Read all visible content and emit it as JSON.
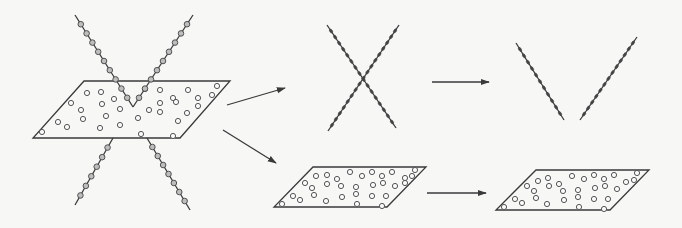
{
  "figure": {
    "type": "schematic",
    "colors": {
      "ink": "#3a3a3a",
      "paper": "#f7f7f5"
    }
  },
  "panels": {
    "source": {
      "plane": [
        [
          84,
          81
        ],
        [
          230,
          81
        ],
        [
          180,
          138
        ],
        [
          33,
          138
        ]
      ],
      "plane_dots": [
        [
          87,
          93
        ],
        [
          101,
          92
        ],
        [
          114,
          99
        ],
        [
          71,
          103
        ],
        [
          81,
          110
        ],
        [
          102,
          104
        ],
        [
          120,
          109
        ],
        [
          145,
          89
        ],
        [
          160,
          90
        ],
        [
          173,
          98
        ],
        [
          188,
          90
        ],
        [
          198,
          98
        ],
        [
          212,
          95
        ],
        [
          217,
          86
        ],
        [
          160,
          103
        ],
        [
          176,
          102
        ],
        [
          198,
          106
        ],
        [
          83,
          119
        ],
        [
          106,
          116
        ],
        [
          149,
          110
        ],
        [
          187,
          113
        ],
        [
          58,
          122
        ],
        [
          67,
          127
        ],
        [
          100,
          128
        ],
        [
          120,
          125
        ],
        [
          138,
          118
        ],
        [
          160,
          112
        ],
        [
          178,
          121
        ],
        [
          42,
          132
        ],
        [
          141,
          134
        ],
        [
          173,
          136
        ]
      ],
      "line_upper_left": {
        "from": [
          75,
          15
        ],
        "to": [
          133,
          107
        ],
        "marker": "grey-ring"
      },
      "line_upper_right": {
        "from": [
          193,
          15
        ],
        "to": [
          133,
          107
        ],
        "marker": "grey-ring"
      },
      "line_lower_left": {
        "from": [
          113,
          138
        ],
        "to": [
          75,
          205
        ],
        "marker": "grey-ring"
      },
      "line_lower_right": {
        "from": [
          147,
          138
        ],
        "to": [
          190,
          210
        ],
        "marker": "grey-ring"
      }
    },
    "arrows": [
      {
        "name": "arrow-source-to-lines",
        "from": [
          227,
          105
        ],
        "to": [
          285,
          88
        ]
      },
      {
        "name": "arrow-source-to-plane",
        "from": [
          223,
          130
        ],
        "to": [
          276,
          163
        ]
      },
      {
        "name": "arrow-lines-to-v",
        "from": [
          432,
          82
        ],
        "to": [
          489,
          82
        ]
      },
      {
        "name": "arrow-plane-to-plane",
        "from": [
          427,
          193
        ],
        "to": [
          486,
          193
        ]
      }
    ],
    "middle_lines": {
      "line_a": {
        "from": [
          327,
          25
        ],
        "to": [
          396,
          128
        ],
        "marker": "solid"
      },
      "line_b": {
        "from": [
          399,
          25
        ],
        "to": [
          328,
          131
        ],
        "marker": "solid"
      }
    },
    "middle_plane": {
      "plane": [
        [
          313,
          167
        ],
        [
          426,
          167
        ],
        [
          387,
          207
        ],
        [
          274,
          207
        ]
      ],
      "plane_dots": [
        [
          316,
          176
        ],
        [
          327,
          175
        ],
        [
          350,
          172
        ],
        [
          362,
          176
        ],
        [
          372,
          172
        ],
        [
          382,
          176
        ],
        [
          392,
          172
        ],
        [
          415,
          170
        ],
        [
          405,
          178
        ],
        [
          412,
          176
        ],
        [
          305,
          183
        ],
        [
          312,
          188
        ],
        [
          327,
          184
        ],
        [
          337,
          179
        ],
        [
          341,
          186
        ],
        [
          356,
          187
        ],
        [
          373,
          185
        ],
        [
          383,
          183
        ],
        [
          395,
          186
        ],
        [
          293,
          196
        ],
        [
          300,
          200
        ],
        [
          314,
          195
        ],
        [
          326,
          201
        ],
        [
          342,
          197
        ],
        [
          356,
          194
        ],
        [
          372,
          196
        ],
        [
          386,
          196
        ],
        [
          282,
          204
        ],
        [
          357,
          204
        ],
        [
          382,
          206
        ],
        [
          405,
          183
        ]
      ]
    },
    "right_v": {
      "line_left": {
        "from": [
          516,
          43
        ],
        "to": [
          564,
          120
        ],
        "marker": "solid"
      },
      "line_right": {
        "from": [
          637,
          37
        ],
        "to": [
          580,
          120
        ],
        "marker": "solid"
      }
    },
    "right_plane": {
      "plane": [
        [
          536,
          170
        ],
        [
          649,
          170
        ],
        [
          610,
          210
        ],
        [
          496,
          210
        ]
      ],
      "plane_dots": [
        [
          538,
          181
        ],
        [
          548,
          178
        ],
        [
          572,
          176
        ],
        [
          584,
          179
        ],
        [
          594,
          175
        ],
        [
          604,
          179
        ],
        [
          614,
          175
        ],
        [
          637,
          173
        ],
        [
          626,
          182
        ],
        [
          634,
          180
        ],
        [
          527,
          186
        ],
        [
          534,
          191
        ],
        [
          549,
          186
        ],
        [
          559,
          184
        ],
        [
          563,
          191
        ],
        [
          578,
          190
        ],
        [
          595,
          188
        ],
        [
          605,
          186
        ],
        [
          617,
          189
        ],
        [
          515,
          199
        ],
        [
          522,
          203
        ],
        [
          536,
          198
        ],
        [
          547,
          204
        ],
        [
          564,
          200
        ],
        [
          578,
          197
        ],
        [
          594,
          199
        ],
        [
          608,
          199
        ],
        [
          504,
          207
        ],
        [
          579,
          207
        ],
        [
          604,
          209
        ]
      ]
    }
  }
}
